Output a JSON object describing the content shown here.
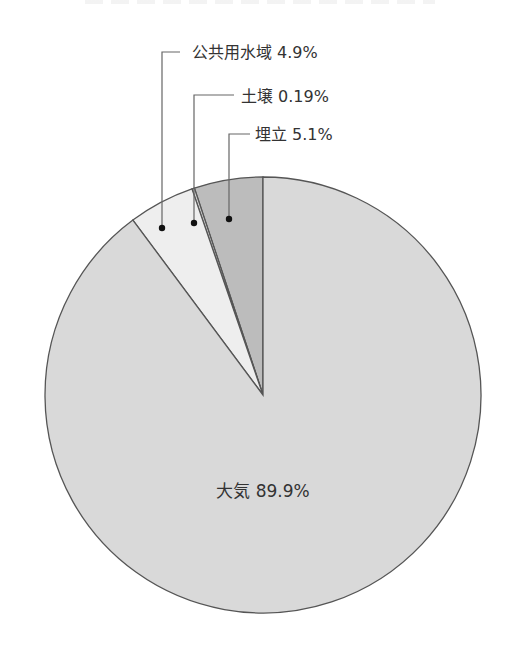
{
  "chart_data": {
    "type": "pie",
    "title": "",
    "start_angle_deg": 0,
    "direction": "counterclockwise",
    "slices": [
      {
        "label": "埋立",
        "value": 5.1,
        "display": "埋立 5.1%",
        "color": "#bcbcbc"
      },
      {
        "label": "土壌",
        "value": 0.19,
        "display": "土壌 0.19%",
        "color": "#cfcfcf"
      },
      {
        "label": "公共用水域",
        "value": 4.9,
        "display": "公共用水域 4.9%",
        "color": "#eeeeee"
      },
      {
        "label": "大気",
        "value": 89.9,
        "display": "大気 89.9%",
        "color": "#d9d9d9"
      }
    ],
    "unit": "%",
    "legend": "none (leader-line labels)"
  },
  "labels": {
    "water": "公共用水域 4.9%",
    "soil": "土壌 0.19%",
    "landfill": "埋立 5.1%",
    "air": "大気 89.9%"
  },
  "colors": {
    "air": "#d9d9d9",
    "water": "#eeeeee",
    "soil": "#cfcfcf",
    "landfill": "#bcbcbc",
    "outline": "#555555",
    "text": "#333333"
  }
}
